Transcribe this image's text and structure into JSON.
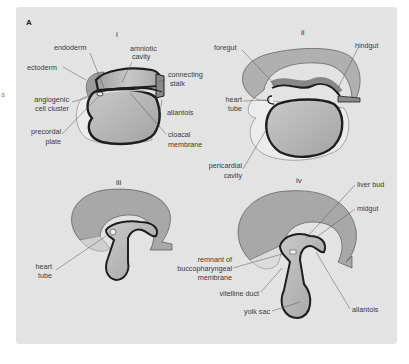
{
  "figure": {
    "panel_letter": "A",
    "stray_mark": "a",
    "colors": {
      "page_bg": "#ffffff",
      "panel_bg": "#e3e3e3",
      "tissue_dark": "#9a9a9a",
      "tissue_mid": "#b8b8b8",
      "tissue_light": "#d8d8d8",
      "outline": "#1e1e1e",
      "leader": "#555555"
    },
    "stages": [
      {
        "numeral": "i",
        "labels": [
          "endoderm",
          "amniotic cavity",
          "ectoderm",
          "connecting stalk",
          "angiogenic cell cluster",
          "allantois",
          "precordal plate",
          "cloacal membrane"
        ]
      },
      {
        "numeral": "ii",
        "labels": [
          "foregut",
          "hindgut",
          "heart tube",
          "pericardial cavity"
        ]
      },
      {
        "numeral": "iii",
        "labels": [
          "heart tube"
        ]
      },
      {
        "numeral": "iv",
        "labels": [
          "liver bud",
          "midgut",
          "remnant of buccopharyngeal membrane",
          "vitelline duct",
          "yolk sac",
          "allantois"
        ]
      }
    ]
  },
  "text": {
    "i": {
      "numeral": "i",
      "endoderm": "endoderm",
      "amniotic_1": "amniotic",
      "amniotic_2": "cavity",
      "ectoderm": "ectoderm",
      "connecting_1": "connecting",
      "connecting_2": "stalk",
      "angiogenic_1": "angiogenic",
      "angiogenic_2": "cell cluster",
      "allantois": "allantois",
      "precordal_1": "precordal",
      "precordal_2": "plate",
      "cloacal_1": "cloacal",
      "cloacal_2": "membrane"
    },
    "ii": {
      "numeral": "ii",
      "foregut": "foregut",
      "hindgut": "hindgut",
      "heart_1": "heart",
      "heart_2": "tube",
      "pericardial_1": "pericardial",
      "pericardial_2": "cavity"
    },
    "iii": {
      "numeral": "iii",
      "heart_1": "heart",
      "heart_2": "tube"
    },
    "iv": {
      "numeral": "iv",
      "liver_bud": "liver bud",
      "midgut": "midgut",
      "remnant_1": "remnant of",
      "remnant_2": "buccopharyngeal",
      "remnant_3": "membrane",
      "vitelline": "vitelline duct",
      "yolk": "yolk sac",
      "allantois": "allantois"
    }
  }
}
